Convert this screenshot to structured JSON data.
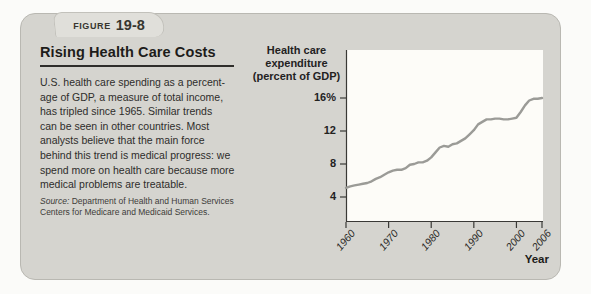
{
  "figure": {
    "label": "FIGURE",
    "number": "19-8"
  },
  "left": {
    "title": "Rising Health Care Costs",
    "body": "U.S. health care spending as a percent-\nage of GDP, a measure of total income,\nhas tripled since 1965. Similar trends\ncan be seen in other countries. Most\nanalysts believe that the main force\nbehind this trend is medical progress: we\nspend more on health care because more\nmedical problems are treatable.",
    "source_label": "Source:",
    "source_text": "Department of Health and Human Services\nCenters for Medicare and Medicaid Services."
  },
  "chart": {
    "y_axis_title": "Health care\nexpenditure\n(percent of GDP)",
    "x_axis_title": "Year",
    "colors": {
      "panel": "#d5d4cf",
      "tab": "#e0dfda",
      "plot_background": "#fdfcf8",
      "line": "#9b9b97",
      "axis": "#3a3936",
      "text": "#2b2a28"
    }
  },
  "chart_data": {
    "type": "line",
    "title": "Rising Health Care Costs",
    "xlabel": "Year",
    "ylabel": "Health care expenditure (percent of GDP)",
    "x": [
      1960,
      1961,
      1962,
      1963,
      1964,
      1965,
      1966,
      1967,
      1968,
      1969,
      1970,
      1971,
      1972,
      1973,
      1974,
      1975,
      1976,
      1977,
      1978,
      1979,
      1980,
      1981,
      1982,
      1983,
      1984,
      1985,
      1986,
      1987,
      1988,
      1989,
      1990,
      1991,
      1992,
      1993,
      1994,
      1995,
      1996,
      1997,
      1998,
      1999,
      2000,
      2001,
      2002,
      2003,
      2004,
      2005,
      2006
    ],
    "values": [
      5.1,
      5.3,
      5.4,
      5.5,
      5.6,
      5.7,
      5.9,
      6.2,
      6.4,
      6.7,
      7.0,
      7.2,
      7.3,
      7.3,
      7.5,
      7.9,
      8.0,
      8.2,
      8.2,
      8.4,
      8.8,
      9.4,
      10.0,
      10.2,
      10.1,
      10.4,
      10.5,
      10.8,
      11.1,
      11.6,
      12.1,
      12.8,
      13.1,
      13.4,
      13.4,
      13.5,
      13.5,
      13.4,
      13.4,
      13.5,
      13.6,
      14.3,
      15.1,
      15.7,
      15.9,
      15.9,
      16.0
    ],
    "x_ticks": [
      1960,
      1970,
      1980,
      1990,
      2000,
      2006
    ],
    "y_ticks": [
      {
        "label": "16%",
        "value": 16
      },
      {
        "label": "12",
        "value": 12
      },
      {
        "label": "8",
        "value": 8
      },
      {
        "label": "4",
        "value": 4
      }
    ],
    "xlim": [
      1960,
      2006
    ],
    "ylim": [
      1,
      21.8
    ],
    "grid": false,
    "legend": "none"
  }
}
